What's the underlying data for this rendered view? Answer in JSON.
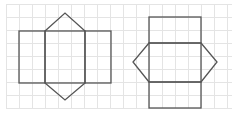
{
  "diagram": {
    "colors": {
      "grid": "#e4e4e4",
      "stroke": "#555555",
      "background": "#ffffff"
    },
    "grid": {
      "x0": 6,
      "y0": 4,
      "step": 13,
      "x1": 232,
      "y1": 108
    },
    "net_left": {
      "rects": [
        {
          "x": 19,
          "y": 31,
          "w": 26,
          "h": 52
        },
        {
          "x": 45,
          "y": 31,
          "w": 40,
          "h": 52
        },
        {
          "x": 85,
          "y": 31,
          "w": 26,
          "h": 52
        }
      ],
      "triangles": [
        "45,31 65,13 85,31",
        "45,83 65,100 85,83"
      ]
    },
    "net_right": {
      "rects": [
        {
          "x": 149,
          "y": 17,
          "w": 52,
          "h": 26
        },
        {
          "x": 149,
          "y": 43,
          "w": 52,
          "h": 39
        },
        {
          "x": 149,
          "y": 82,
          "w": 52,
          "h": 26
        }
      ],
      "triangles": [
        "149,43 133,62 149,82",
        "201,43 217,62 201,82"
      ]
    }
  }
}
